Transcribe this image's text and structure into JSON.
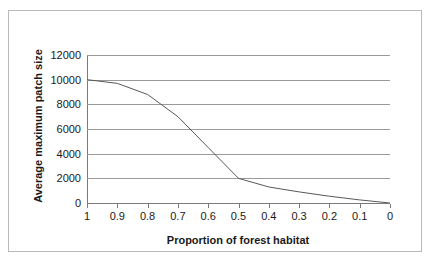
{
  "chart_data": {
    "type": "line",
    "title": "",
    "xlabel": "Proportion of forest habitat",
    "ylabel": "Average maximum patch size",
    "x": [
      1,
      0.9,
      0.8,
      0.7,
      0.6,
      0.5,
      0.4,
      0.3,
      0.2,
      0.1,
      0
    ],
    "values": [
      10000,
      9700,
      8800,
      7000,
      4500,
      2000,
      1300,
      900,
      550,
      250,
      0
    ],
    "series": [
      {
        "name": "Average maximum patch size",
        "values": [
          10000,
          9700,
          8800,
          7000,
          4500,
          2000,
          1300,
          900,
          550,
          250,
          0
        ]
      }
    ],
    "xlim": [
      1,
      0
    ],
    "ylim": [
      0,
      12000
    ],
    "x_tick_labels": [
      "1",
      "0.9",
      "0.8",
      "0.7",
      "0.6",
      "0.5",
      "0.4",
      "0.3",
      "0.2",
      "0.1",
      "0"
    ],
    "y_tick_labels": [
      "12000",
      "10000",
      "8000",
      "6000",
      "4000",
      "2000",
      "0"
    ],
    "y_ticks": [
      12000,
      10000,
      8000,
      6000,
      4000,
      2000,
      0
    ],
    "grid": "horizontal",
    "legend": "none",
    "x_axis_reversed": true,
    "line_color": "#595959",
    "gridline_color": "#9a9a9a",
    "frame_color": "#b9b9b9",
    "background_color": "#ffffff"
  }
}
